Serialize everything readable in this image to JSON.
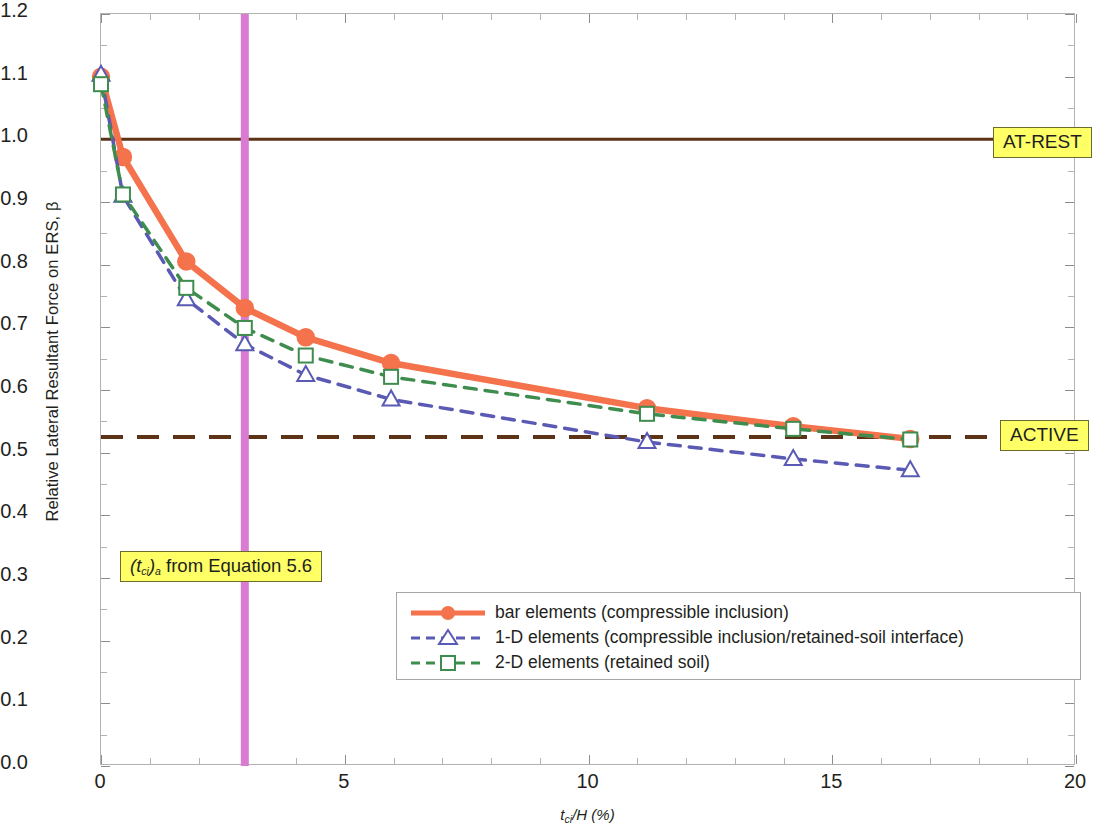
{
  "chart_data": {
    "type": "line",
    "title": "",
    "xlabel": "t_ci/H (%)",
    "ylabel": "Relative Lateral Resultant Force on ERS, β",
    "xlim": [
      0,
      20
    ],
    "ylim": [
      0,
      1.2
    ],
    "xticks": [
      0,
      5,
      10,
      15,
      20
    ],
    "xtick_labels": [
      "0",
      "5",
      "10",
      "15",
      "20"
    ],
    "yticks": [
      0.0,
      0.1,
      0.2,
      0.3,
      0.4,
      0.5,
      0.6,
      0.7,
      0.8,
      0.9,
      1.0,
      1.1,
      1.2
    ],
    "ytick_labels": [
      "0.0",
      "0.1",
      "0.2",
      "0.3",
      "0.4",
      "0.5",
      "0.6",
      "0.7",
      "0.8",
      "0.9",
      "1.0",
      "1.1",
      "1.2"
    ],
    "x_minor_step": 1,
    "y_minor_step": 0.05,
    "grid": false,
    "legend_position": "lower center",
    "series": [
      {
        "name": "bar elements (compressible inclusion)",
        "color": "#F4724C",
        "style": "solid",
        "marker": "circle",
        "x": [
          0.0,
          0.45,
          1.75,
          2.95,
          4.2,
          5.95,
          11.2,
          14.2,
          16.6
        ],
        "y": [
          1.1,
          0.972,
          0.805,
          0.731,
          0.684,
          0.643,
          0.571,
          0.542,
          0.522
        ]
      },
      {
        "name": "1-D elements (compressible inclusion/retained-soil interface)",
        "color": "#5A5AB4",
        "style": "dashed",
        "marker": "triangle",
        "x": [
          0.0,
          0.45,
          1.75,
          2.95,
          4.2,
          5.95,
          11.2,
          14.2,
          16.6
        ],
        "y": [
          1.103,
          0.91,
          0.745,
          0.673,
          0.624,
          0.585,
          0.517,
          0.49,
          0.472
        ]
      },
      {
        "name": "2-D elements (retained soil)",
        "color": "#3E8C4E",
        "style": "dashed",
        "marker": "square",
        "x": [
          0.0,
          0.45,
          1.75,
          2.95,
          4.2,
          5.95,
          11.2,
          14.2,
          16.6
        ],
        "y": [
          1.088,
          0.912,
          0.763,
          0.699,
          0.655,
          0.621,
          0.562,
          0.538,
          0.521
        ]
      }
    ],
    "reference_lines": [
      {
        "name": "AT-REST",
        "value": 1.0,
        "orientation": "horizontal",
        "color": "#5C3317",
        "style": "solid"
      },
      {
        "name": "ACTIVE",
        "value": 0.525,
        "orientation": "horizontal",
        "color": "#5C3317",
        "style": "dashed"
      },
      {
        "name": "(t_ci)_a from Equation 5.6",
        "value": 2.95,
        "orientation": "vertical",
        "color": "#D97BD0",
        "style": "solid"
      }
    ],
    "annotations": [
      {
        "name": "AT-REST",
        "text": "AT-REST",
        "bg": "#ffff66"
      },
      {
        "name": "ACTIVE",
        "text": "ACTIVE",
        "bg": "#ffff66"
      },
      {
        "name": "tci-equation",
        "text": "(t_ci)_a from Equation 5.6",
        "bg": "#ffff66"
      }
    ]
  },
  "labels": {
    "y_axis_title": "Relative Lateral Resultant Force on ERS, β",
    "x_axis_main": "t",
    "x_axis_sub": "ci",
    "x_axis_rest": "/H (%)",
    "at_rest": "AT-REST",
    "active": "ACTIVE",
    "tci_open": "(t",
    "tci_sub": "ci",
    "tci_close": ")",
    "tci_sub_a": "a",
    "tci_rest": " from Equation 5.6"
  },
  "legend": {
    "items": [
      {
        "label": "bar elements (compressible inclusion)",
        "color": "#F4724C",
        "marker": "circle",
        "style": "solid"
      },
      {
        "label": "1-D elements (compressible inclusion/retained-soil interface)",
        "color": "#5A5AB4",
        "marker": "triangle",
        "style": "dashed"
      },
      {
        "label": "2-D elements (retained soil)",
        "color": "#3E8C4E",
        "marker": "square",
        "style": "dashed"
      }
    ]
  },
  "ytick_labels": [
    "1.2",
    "1.1",
    "1.0",
    "0.9",
    "0.8",
    "0.7",
    "0.6",
    "0.5",
    "0.4",
    "0.3",
    "0.2",
    "0.1",
    "0.0"
  ],
  "xtick_labels": [
    "0",
    "5",
    "10",
    "15",
    "20"
  ]
}
